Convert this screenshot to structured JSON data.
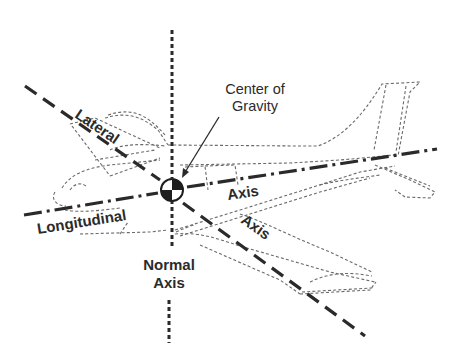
{
  "diagram": {
    "labels": {
      "center_of_gravity_line1": "Center of",
      "center_of_gravity_line2": "Gravity",
      "lateral": "Lateral",
      "lateral_axis": "Axis",
      "longitudinal": "Longitudinal",
      "longitudinal_axis": "Axis",
      "normal_line1": "Normal",
      "normal_line2": "Axis"
    },
    "axes": [
      {
        "name": "Normal Axis",
        "style": "dotted",
        "orientation": "vertical"
      },
      {
        "name": "Lateral Axis",
        "style": "dashed",
        "orientation": "diagonal"
      },
      {
        "name": "Longitudinal Axis",
        "style": "dash-dot",
        "orientation": "near-horizontal"
      }
    ],
    "colors": {
      "ink": "#2a2a2a",
      "outline": "#6a6a6a",
      "background": "#ffffff"
    }
  }
}
